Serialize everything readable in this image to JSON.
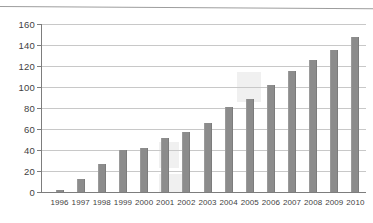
{
  "chart_data": {
    "type": "bar",
    "title": "",
    "subtitle": "",
    "xlabel": "",
    "ylabel": "",
    "categories": [
      "1996",
      "1997",
      "1998",
      "1999",
      "2000",
      "2001",
      "2002",
      "2003",
      "2004",
      "2005",
      "2006",
      "2007",
      "2008",
      "2009",
      "2010"
    ],
    "values": [
      2,
      12,
      27,
      40,
      42,
      51,
      57,
      66,
      81,
      89,
      102,
      115,
      126,
      135,
      148
    ],
    "series": [
      {
        "name": "",
        "values": [
          2,
          12,
          27,
          40,
          42,
          51,
          57,
          66,
          81,
          89,
          102,
          115,
          126,
          135,
          148
        ]
      }
    ],
    "ylim": [
      0,
      160
    ],
    "yticks": [
      0,
      20,
      40,
      60,
      80,
      100,
      120,
      140,
      160
    ],
    "ytick_labels": [
      "0",
      "20",
      "40",
      "60",
      "80",
      "100",
      "120",
      "140",
      "160"
    ],
    "grid": true,
    "grid_axis": "y",
    "legend": false,
    "legend_position": "none",
    "annotations": [],
    "bar_color": "#8c8c8c",
    "grid_color": "#c8c8c8",
    "axis_color": "#7d7d7d",
    "background_color": "#ffffff"
  }
}
